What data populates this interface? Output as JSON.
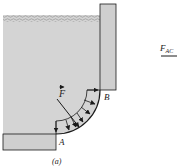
{
  "figure": {
    "caption": "(a)",
    "labels": {
      "force": "F",
      "point_a": "A",
      "point_b": "B",
      "side_force": "F",
      "side_force_sub": "AC"
    },
    "colors": {
      "water": "#d4d4d4",
      "wall": "#cfcfcf",
      "stroke": "#1a1a1a",
      "surface": "#9a9a9a"
    }
  }
}
